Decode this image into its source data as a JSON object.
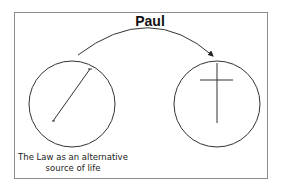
{
  "diagram": {
    "title": "Paul",
    "left_node": {
      "label_line1": "The Law as an alternative",
      "label_line2": "source of life",
      "symbol": "diagonal-line"
    },
    "right_node": {
      "label_line1": "",
      "symbol": "cross-icon"
    },
    "edge": {
      "from": "left_node",
      "to": "right_node",
      "style": "curved-arrow"
    },
    "colors": {
      "stroke": "#333333",
      "frame": "#8c8c8c",
      "text": "#111111"
    }
  }
}
